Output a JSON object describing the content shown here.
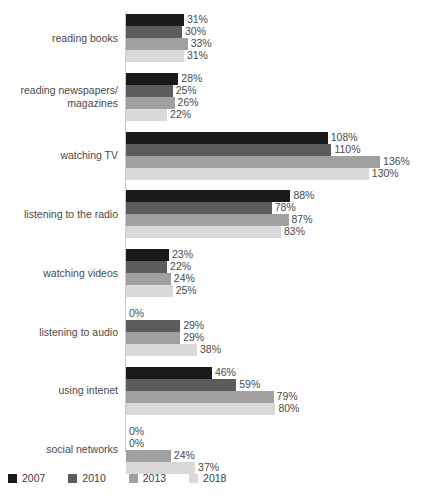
{
  "chart_data": {
    "type": "bar",
    "orientation": "horizontal",
    "title": "",
    "subtitle": "",
    "xlabel": "",
    "ylabel": "",
    "grid": false,
    "legend_position": "bottom-left",
    "value_suffix": "%",
    "xlim": [
      0,
      136
    ],
    "categories": [
      "reading books",
      "reading newspapers/\nmagazines",
      "watching TV",
      "listening to the radio",
      "watching videos",
      "listening to audio",
      "using intenet",
      "social networks"
    ],
    "series": [
      {
        "name": "2007",
        "color": "#1a1a1a",
        "values": [
          31,
          28,
          108,
          88,
          23,
          0,
          46,
          0
        ],
        "labels": [
          "31%",
          "28%",
          "108%",
          "88%",
          "23%",
          "0%",
          "46%",
          "0%"
        ]
      },
      {
        "name": "2010",
        "color": "#5c5c5c",
        "values": [
          30,
          25,
          110,
          78,
          22,
          29,
          59,
          0
        ],
        "labels": [
          "30%",
          "25%",
          "110%",
          "78%",
          "22%",
          "29%",
          "59%",
          "0%"
        ]
      },
      {
        "name": "2013",
        "color": "#a0a0a0",
        "values": [
          33,
          26,
          136,
          87,
          24,
          29,
          79,
          24
        ],
        "labels": [
          "33%",
          "26%",
          "136%",
          "87%",
          "24%",
          "29%",
          "79%",
          "24%"
        ]
      },
      {
        "name": "2018",
        "color": "#d9d9d9",
        "values": [
          31,
          22,
          130,
          83,
          25,
          38,
          80,
          37
        ],
        "labels": [
          "31%",
          "22%",
          "130%",
          "83%",
          "25%",
          "38%",
          "80%",
          "37%"
        ]
      }
    ]
  },
  "legend": {
    "items": [
      {
        "label": "2007",
        "color": "#1a1a1a"
      },
      {
        "label": "2010",
        "color": "#5c5c5c"
      },
      {
        "label": "2013",
        "color": "#a0a0a0"
      },
      {
        "label": "2018",
        "color": "#d9d9d9"
      }
    ]
  },
  "scale": {
    "px_per_percent": 1.868,
    "plot_left_px": 126,
    "group_top_px": 14,
    "group_pitch_px": 58.8,
    "bar_height_px": 12
  }
}
